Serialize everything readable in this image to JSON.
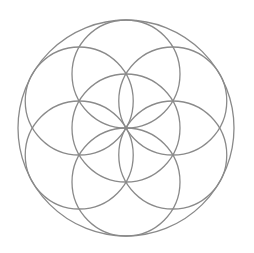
{
  "diagram": {
    "name": "seed-of-life",
    "stroke_color": "#8a8a8a",
    "stroke_width": 1.3,
    "background": "#ffffff",
    "center": [
      126,
      128
    ],
    "outer_radius": 108,
    "petal_radius": 54,
    "petal_count": 6,
    "petal_start_angle_deg": -90
  }
}
